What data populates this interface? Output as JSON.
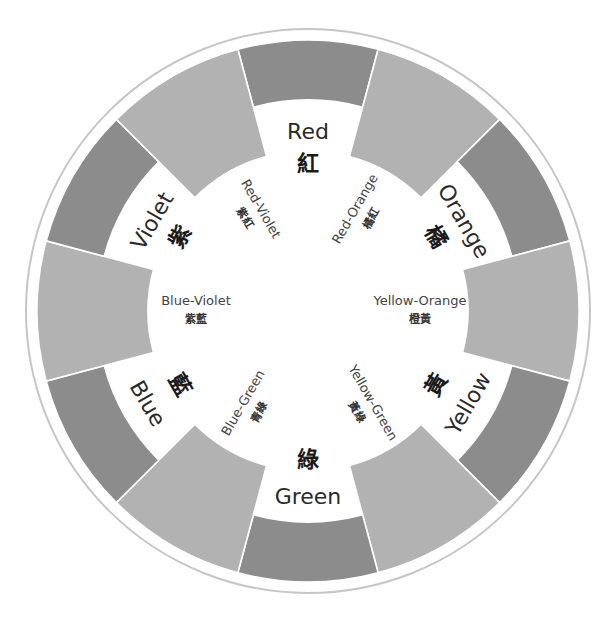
{
  "colors": {
    "primary_segment": "#8c8c8c",
    "tertiary_segment": "#b2b2b2",
    "outer_ring": "#c6c6c6",
    "separator": "#ffffff",
    "background": "#ffffff"
  },
  "segments": [
    {
      "name": "Red",
      "zh": "紅",
      "kind": "primary",
      "angle_deg": 0
    },
    {
      "name": "Red-Orange",
      "zh": "橘紅",
      "kind": "tertiary",
      "angle_deg": 30
    },
    {
      "name": "Orange",
      "zh": "橘",
      "kind": "primary",
      "angle_deg": 60
    },
    {
      "name": "Yellow-Orange",
      "zh": "橙黃",
      "kind": "tertiary",
      "angle_deg": 90
    },
    {
      "name": "Yellow",
      "zh": "黃",
      "kind": "primary",
      "angle_deg": 120
    },
    {
      "name": "Yellow-Green",
      "zh": "黃綠",
      "kind": "tertiary",
      "angle_deg": 150
    },
    {
      "name": "Green",
      "zh": "綠",
      "kind": "primary",
      "angle_deg": 180
    },
    {
      "name": "Blue-Green",
      "zh": "青綠",
      "kind": "tertiary",
      "angle_deg": 210
    },
    {
      "name": "Blue",
      "zh": "藍",
      "kind": "primary",
      "angle_deg": 240
    },
    {
      "name": "Blue-Violet",
      "zh": "紫藍",
      "kind": "tertiary",
      "angle_deg": 270
    },
    {
      "name": "Violet",
      "zh": "紫",
      "kind": "primary",
      "angle_deg": 300
    },
    {
      "name": "Red-Violet",
      "zh": "紫紅",
      "kind": "tertiary",
      "angle_deg": 330
    }
  ]
}
